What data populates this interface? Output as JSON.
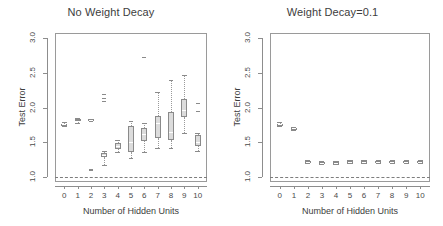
{
  "figure": {
    "width": 443,
    "height": 226,
    "background": "#ffffff",
    "axis_color": "#8d8d8d",
    "box_fill": "#dcdcdc",
    "box_stroke": "#8a8a8a",
    "ref_line_color": "#7d7d7d"
  },
  "chart_data": [
    {
      "type": "box",
      "panel_id": "left",
      "title": "No Weight Decay",
      "xlabel": "Number of Hidden Units",
      "ylabel": "Test Error",
      "categories": [
        "0",
        "1",
        "2",
        "3",
        "4",
        "5",
        "6",
        "7",
        "8",
        "9",
        "10"
      ],
      "ylim": [
        0.93,
        3.07
      ],
      "xlim": [
        -0.7,
        10.7
      ],
      "yticks": [
        1.0,
        1.5,
        2.0,
        2.5,
        3.0
      ],
      "ytick_labels": [
        "1.0",
        "1.5",
        "2.0",
        "2.5",
        "3.0"
      ],
      "grid": false,
      "legend": null,
      "reference_line": {
        "y": 1.0,
        "style": "dashed",
        "label": ""
      },
      "boxes": [
        {
          "category": "0",
          "whisker_low": 1.73,
          "q1": 1.75,
          "median": 1.76,
          "q3": 1.77,
          "whisker_high": 1.79,
          "outliers": []
        },
        {
          "category": "1",
          "whisker_low": 1.78,
          "q1": 1.8,
          "median": 1.81,
          "q3": 1.83,
          "whisker_high": 1.85,
          "outliers": []
        },
        {
          "category": "2",
          "whisker_low": 1.8,
          "q1": 1.81,
          "median": 1.82,
          "q3": 1.83,
          "whisker_high": 1.84,
          "outliers": [
            1.1,
            1.12
          ]
        },
        {
          "category": "3",
          "whisker_low": 1.18,
          "q1": 1.29,
          "median": 1.32,
          "q3": 1.35,
          "whisker_high": 1.37,
          "outliers": [
            2.1,
            2.13,
            2.19
          ]
        },
        {
          "category": "4",
          "whisker_low": 1.36,
          "q1": 1.4,
          "median": 1.44,
          "q3": 1.49,
          "whisker_high": 1.53,
          "outliers": []
        },
        {
          "category": "5",
          "whisker_low": 1.28,
          "q1": 1.36,
          "median": 1.5,
          "q3": 1.73,
          "whisker_high": 1.8,
          "outliers": []
        },
        {
          "category": "6",
          "whisker_low": 1.36,
          "q1": 1.52,
          "median": 1.62,
          "q3": 1.7,
          "whisker_high": 1.78,
          "outliers": [
            2.72
          ]
        },
        {
          "category": "7",
          "whisker_low": 1.42,
          "q1": 1.56,
          "median": 1.78,
          "q3": 1.88,
          "whisker_high": 2.22,
          "outliers": []
        },
        {
          "category": "8",
          "whisker_low": 1.42,
          "q1": 1.53,
          "median": 1.65,
          "q3": 1.93,
          "whisker_high": 2.4,
          "outliers": []
        },
        {
          "category": "9",
          "whisker_low": 1.63,
          "q1": 1.86,
          "median": 1.96,
          "q3": 2.12,
          "whisker_high": 2.47,
          "outliers": []
        },
        {
          "category": "10",
          "whisker_low": 1.38,
          "q1": 1.45,
          "median": 1.51,
          "q3": 1.61,
          "whisker_high": 1.63,
          "outliers": [
            1.95,
            2.07
          ]
        }
      ]
    },
    {
      "type": "box",
      "panel_id": "right",
      "title": "Weight Decay=0.1",
      "xlabel": "Number of Hidden Units",
      "ylabel": "Test Error",
      "categories": [
        "0",
        "1",
        "2",
        "3",
        "4",
        "5",
        "6",
        "7",
        "8",
        "9",
        "10"
      ],
      "ylim": [
        0.93,
        3.07
      ],
      "xlim": [
        -0.7,
        10.7
      ],
      "yticks": [
        1.0,
        1.5,
        2.0,
        2.5,
        3.0
      ],
      "ytick_labels": [
        "1.0",
        "1.5",
        "2.0",
        "2.5",
        "3.0"
      ],
      "grid": false,
      "legend": null,
      "reference_line": {
        "y": 1.0,
        "style": "dashed",
        "label": ""
      },
      "boxes": [
        {
          "category": "0",
          "whisker_low": 1.73,
          "q1": 1.75,
          "median": 1.76,
          "q3": 1.77,
          "whisker_high": 1.79,
          "outliers": []
        },
        {
          "category": "1",
          "whisker_low": 1.68,
          "q1": 1.69,
          "median": 1.7,
          "q3": 1.71,
          "whisker_high": 1.72,
          "outliers": []
        },
        {
          "category": "2",
          "whisker_low": 1.2,
          "q1": 1.21,
          "median": 1.22,
          "q3": 1.23,
          "whisker_high": 1.25,
          "outliers": []
        },
        {
          "category": "3",
          "whisker_low": 1.19,
          "q1": 1.2,
          "median": 1.21,
          "q3": 1.22,
          "whisker_high": 1.23,
          "outliers": []
        },
        {
          "category": "4",
          "whisker_low": 1.19,
          "q1": 1.2,
          "median": 1.21,
          "q3": 1.22,
          "whisker_high": 1.23,
          "outliers": []
        },
        {
          "category": "5",
          "whisker_low": 1.2,
          "q1": 1.21,
          "median": 1.22,
          "q3": 1.23,
          "whisker_high": 1.24,
          "outliers": []
        },
        {
          "category": "6",
          "whisker_low": 1.2,
          "q1": 1.21,
          "median": 1.22,
          "q3": 1.23,
          "whisker_high": 1.24,
          "outliers": []
        },
        {
          "category": "7",
          "whisker_low": 1.2,
          "q1": 1.21,
          "median": 1.22,
          "q3": 1.23,
          "whisker_high": 1.24,
          "outliers": []
        },
        {
          "category": "8",
          "whisker_low": 1.2,
          "q1": 1.21,
          "median": 1.22,
          "q3": 1.23,
          "whisker_high": 1.24,
          "outliers": []
        },
        {
          "category": "9",
          "whisker_low": 1.2,
          "q1": 1.21,
          "median": 1.22,
          "q3": 1.23,
          "whisker_high": 1.24,
          "outliers": []
        },
        {
          "category": "10",
          "whisker_low": 1.2,
          "q1": 1.21,
          "median": 1.22,
          "q3": 1.23,
          "whisker_high": 1.25,
          "outliers": []
        }
      ]
    }
  ]
}
